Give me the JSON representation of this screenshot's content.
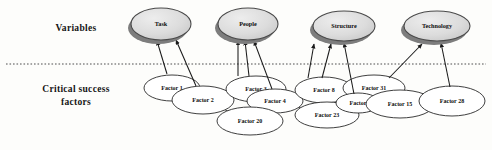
{
  "figure": {
    "background_color": "#fdfdfb"
  },
  "rows": {
    "variables_label": "Variables",
    "factors_label_line1": "Critical success",
    "factors_label_line2": "factors"
  },
  "colors": {
    "variable_fill": "#d8d8d8",
    "variable_stroke": "#4a4a4a",
    "variable_shadow": "#7d7d7d",
    "factor_fill": "#ffffff",
    "factor_stroke": "#2a2a2a",
    "arrow": "#1a1a1a",
    "divider": "#3a3a3a",
    "text": "#0d0d0d"
  },
  "variables": [
    {
      "id": "task",
      "label": "Task",
      "cx": 161,
      "cy": 24,
      "rx": 30,
      "ry": 16
    },
    {
      "id": "people",
      "label": "People",
      "cx": 248,
      "cy": 24,
      "rx": 30,
      "ry": 16
    },
    {
      "id": "structure",
      "label": "Structure",
      "cx": 344,
      "cy": 26,
      "rx": 31,
      "ry": 15
    },
    {
      "id": "technology",
      "label": "Technology",
      "cx": 437,
      "cy": 26,
      "rx": 33,
      "ry": 15
    }
  ],
  "factors": [
    {
      "id": "factor-1",
      "label": "Factor 1",
      "cx": 172,
      "cy": 88,
      "rx": 28,
      "ry": 13
    },
    {
      "id": "factor-2",
      "label": "Factor 2",
      "cx": 203,
      "cy": 100,
      "rx": 31,
      "ry": 14
    },
    {
      "id": "factor-3",
      "label": "Factor 3",
      "cx": 256,
      "cy": 89,
      "rx": 30,
      "ry": 13
    },
    {
      "id": "factor-4",
      "label": "Factor 4",
      "cx": 275,
      "cy": 101,
      "rx": 28,
      "ry": 12
    },
    {
      "id": "factor-20",
      "label": "Factor 20",
      "cx": 250,
      "cy": 121,
      "rx": 33,
      "ry": 14
    },
    {
      "id": "factor-8",
      "label": "Factor 8",
      "cx": 324,
      "cy": 90,
      "rx": 29,
      "ry": 13
    },
    {
      "id": "factor-23",
      "label": "Factor 23",
      "cx": 327,
      "cy": 115,
      "rx": 32,
      "ry": 13
    },
    {
      "id": "factor-31",
      "label": "Factor 31",
      "cx": 374,
      "cy": 88,
      "rx": 31,
      "ry": 13
    },
    {
      "id": "factor-x",
      "label": "Factor",
      "cx": 358,
      "cy": 103,
      "rx": 22,
      "ry": 10
    },
    {
      "id": "factor-15",
      "label": "Factor 15",
      "cx": 400,
      "cy": 104,
      "rx": 34,
      "ry": 14
    },
    {
      "id": "factor-28",
      "label": "Factor 28",
      "cx": 452,
      "cy": 101,
      "rx": 33,
      "ry": 15
    }
  ],
  "arrows": [
    {
      "id": "arrow-factor1-task",
      "from": "factor-1",
      "to": "task",
      "x1": 167,
      "y1": 74,
      "x2": 157,
      "y2": 41
    },
    {
      "id": "arrow-factor2-task",
      "from": "factor-2",
      "to": "task",
      "x1": 196,
      "y1": 86,
      "x2": 176,
      "y2": 40
    },
    {
      "id": "arrow-factor3a-people",
      "from": "factor-3",
      "to": "people",
      "x1": 238,
      "y1": 76,
      "x2": 238,
      "y2": 41
    },
    {
      "id": "arrow-factor3b-people",
      "from": "factor-3",
      "to": "people",
      "x1": 249,
      "y1": 76,
      "x2": 245,
      "y2": 41
    },
    {
      "id": "arrow-factor4-people",
      "from": "factor-4",
      "to": "people",
      "x1": 272,
      "y1": 89,
      "x2": 254,
      "y2": 41
    },
    {
      "id": "arrow-factor8a-structure",
      "from": "factor-8",
      "to": "structure",
      "x1": 308,
      "y1": 78,
      "x2": 314,
      "y2": 44
    },
    {
      "id": "arrow-factor8b-structure",
      "from": "factor-8",
      "to": "structure",
      "x1": 322,
      "y1": 78,
      "x2": 331,
      "y2": 44
    },
    {
      "id": "arrow-factorx-structure",
      "from": "factor-x",
      "to": "structure",
      "x1": 354,
      "y1": 94,
      "x2": 344,
      "y2": 43
    },
    {
      "id": "arrow-factor31-technology",
      "from": "factor-31",
      "to": "technology",
      "x1": 389,
      "y1": 78,
      "x2": 422,
      "y2": 44
    },
    {
      "id": "arrow-factor28-technology",
      "from": "factor-28",
      "to": "technology",
      "x1": 450,
      "y1": 87,
      "x2": 441,
      "y2": 43
    }
  ],
  "links": [
    {
      "id": "link-factor1-factor2",
      "from": "factor-1",
      "to": "factor-2"
    },
    {
      "id": "link-factor2-factor20",
      "from": "factor-2",
      "to": "factor-20"
    },
    {
      "id": "link-factor2-factor3",
      "from": "factor-2",
      "to": "factor-3"
    },
    {
      "id": "link-factor3-factor4",
      "from": "factor-3",
      "to": "factor-4"
    },
    {
      "id": "link-factor20-factor4",
      "from": "factor-20",
      "to": "factor-4"
    },
    {
      "id": "link-factor4-factor23",
      "from": "factor-4",
      "to": "factor-23"
    },
    {
      "id": "link-factor23-factorx",
      "from": "factor-23",
      "to": "factor-x"
    },
    {
      "id": "link-factorx-factor15",
      "from": "factor-x",
      "to": "factor-15"
    },
    {
      "id": "link-factor15-factor28",
      "from": "factor-15",
      "to": "factor-28"
    }
  ],
  "divider": {
    "id": "section-divider",
    "x1": 6,
    "y1": 64,
    "x2": 486,
    "y2": 64,
    "style": "dotted"
  }
}
